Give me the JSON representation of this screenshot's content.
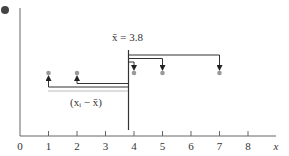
{
  "diagram": {
    "mean_label": "x̄ = 3.8",
    "mean_value": 3.8,
    "deviation_label": "(xᵢ − x̄)",
    "x_axis": {
      "label": "x",
      "ticks": [
        "0",
        "1",
        "2",
        "3",
        "4",
        "5",
        "6",
        "7",
        "8"
      ],
      "range": [
        0,
        8
      ]
    },
    "points": [
      1,
      2,
      4,
      5,
      7
    ],
    "colors": {
      "axis": "#555555",
      "arrow": "#333333",
      "point": "#999999",
      "bullet": "#444444"
    }
  }
}
